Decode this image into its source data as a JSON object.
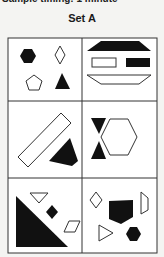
{
  "header": {
    "cut_text": "Sample timing: 1 minute",
    "set_title": "Set A"
  },
  "colors": {
    "fill_dark": "#111111",
    "stroke": "#333333",
    "background": "#ffffff"
  },
  "cells": [
    {
      "position": "row1-col1",
      "shapes": [
        "filled hexagon",
        "outline diamond",
        "outline pentagon",
        "filled triangle"
      ]
    },
    {
      "position": "row1-col2",
      "shapes": [
        "filled trapezoid",
        "outline rectangle",
        "filled rectangle",
        "outline inverted trapezoid"
      ]
    },
    {
      "position": "row2-col1",
      "shapes": [
        "outline diagonal rectangle",
        "filled quadrilateral"
      ]
    },
    {
      "position": "row2-col2",
      "shapes": [
        "filled down triangle",
        "filled up triangle",
        "outline hexagon"
      ]
    },
    {
      "position": "row3-col1",
      "shapes": [
        "filled right triangle",
        "outline down triangle",
        "filled diamond",
        "outline parallelogram"
      ]
    },
    {
      "position": "row3-col2",
      "shapes": [
        "outline diamond",
        "filled pentagon shield",
        "outline trapezoid",
        "outline right-pointing triangle",
        "filled hexagon"
      ]
    }
  ]
}
